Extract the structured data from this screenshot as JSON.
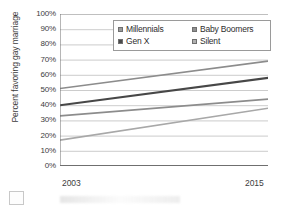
{
  "chart_data": {
    "type": "line",
    "title": "",
    "xlabel": "",
    "ylabel": "Percent favoring gay marriage",
    "x": [
      2003,
      2015
    ],
    "xlim": [
      2003,
      2015
    ],
    "ylim": [
      0,
      100
    ],
    "y_tick_labels": [
      "100%",
      "90%",
      "80%",
      "70%",
      "60%",
      "50%",
      "40%",
      "30%",
      "20%",
      "10%",
      "0%"
    ],
    "y_ticks": [
      100,
      90,
      80,
      70,
      60,
      50,
      40,
      30,
      20,
      10,
      0
    ],
    "x_tick_labels": [
      "2003",
      "2015"
    ],
    "grid": true,
    "legend_position": "top-right-inside",
    "series": [
      {
        "name": "Millennials",
        "values": [
          51,
          69
        ],
        "color": "#8c8c8c"
      },
      {
        "name": "Baby Boomers",
        "values": [
          33,
          44
        ],
        "color": "#8c8c8c"
      },
      {
        "name": "Gen X",
        "values": [
          40,
          58
        ],
        "color": "#474747"
      },
      {
        "name": "Silent",
        "values": [
          17,
          38
        ],
        "color": "#a8a8a8"
      }
    ]
  },
  "legend": {
    "rows": [
      [
        {
          "label": "Millennials",
          "swatch_color": "#9b9b9b"
        },
        {
          "label": "Baby Boomers",
          "swatch_color": "#8f8f8f"
        }
      ],
      [
        {
          "label": "Gen X",
          "swatch_color": "#4a4a4a"
        },
        {
          "label": "Silent",
          "swatch_color": "#b0b0b0"
        }
      ]
    ]
  },
  "axes": {
    "y_title": "Percent favoring gay marriage",
    "x_start_label": "2003",
    "x_end_label": "2015"
  },
  "colors": {
    "axis": "#6f6f6f",
    "grid": "#bfbfbf",
    "text": "#3d3d3d"
  }
}
